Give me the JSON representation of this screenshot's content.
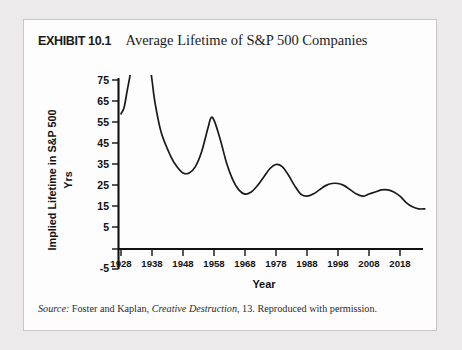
{
  "figure": {
    "exhibit_label": "EXHIBIT 10.1",
    "title": "Average Lifetime of S&P 500 Companies",
    "source_prefix": "Source:",
    "source_author": "Foster and Kaplan,",
    "source_book": "Creative Destruction",
    "source_suffix": ", 13. Reproduced with permission."
  },
  "colors": {
    "page_background": "#eceaea",
    "card_background": "#fdfdfd",
    "card_border": "#c9c7c5",
    "axis": "#111111",
    "curve": "#1a1a1a",
    "text": "#121212"
  },
  "chart_data": {
    "type": "line",
    "title": "Average Lifetime of S&P 500 Companies",
    "xlabel": "Year",
    "ylabel": "Implied Lifetime in S&P 500",
    "ylabel_units": "Yrs",
    "grid": false,
    "legend": "none",
    "xlim": [
      1928,
      2028
    ],
    "ylim": [
      -5,
      75
    ],
    "xticks": [
      1928,
      1938,
      1948,
      1958,
      1968,
      1978,
      1988,
      1998,
      2008,
      2018
    ],
    "xtick_labels": [
      "1928",
      "1938",
      "1948",
      "1958",
      "1968",
      "1978",
      "1988",
      "1998",
      "2008",
      "2018"
    ],
    "yticks": [
      -5,
      5,
      15,
      25,
      35,
      45,
      55,
      65,
      75
    ],
    "ytick_labels": [
      "-5",
      "5",
      "15",
      "25",
      "35",
      "45",
      "55",
      "65",
      "75"
    ],
    "note": "Curve is clipped at the top of the axis; values between 1930 and 1937 exceed 75 years.",
    "series": [
      {
        "name": "Implied Lifetime",
        "x": [
          1928,
          1929,
          1930,
          1931,
          1932,
          1936,
          1937,
          1938,
          1939,
          1941,
          1944,
          1946,
          1948,
          1950,
          1952,
          1954,
          1956,
          1957,
          1958,
          1960,
          1962,
          1964,
          1966,
          1968,
          1970,
          1972,
          1974,
          1976,
          1978,
          1980,
          1982,
          1984,
          1986,
          1988,
          1990,
          1992,
          1994,
          1996,
          1998,
          2000,
          2002,
          2004,
          2006,
          2008,
          2010,
          2012,
          2014,
          2016,
          2018,
          2020,
          2022,
          2024,
          2026
        ],
        "y": [
          59,
          62,
          70,
          78,
          90,
          95,
          86,
          75,
          64,
          50,
          39,
          34,
          31,
          31,
          34,
          41,
          52,
          57,
          56,
          47,
          36,
          28,
          23,
          21,
          22,
          25,
          29,
          33,
          35,
          34,
          30,
          25,
          21,
          20,
          21,
          23,
          25,
          26,
          26,
          25,
          23,
          21,
          20,
          21,
          22,
          23,
          23,
          22,
          20,
          17,
          15,
          14,
          14
        ]
      }
    ]
  }
}
